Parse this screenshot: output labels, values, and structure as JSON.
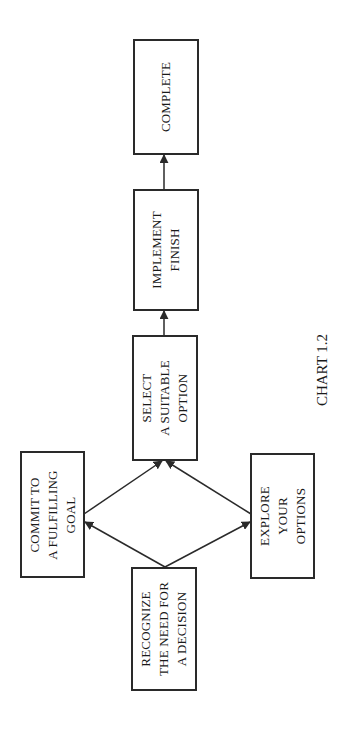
{
  "diagram": {
    "caption": "CHART 1.2",
    "orientation": "rotated-90-ccw",
    "nodes": [
      {
        "id": "recognize",
        "label": "RECOGNIZE\nTHE NEED FOR\nA DECISION"
      },
      {
        "id": "commit",
        "label": "COMMIT TO\nA FULFILLING\nGOAL"
      },
      {
        "id": "explore",
        "label": "EXPLORE\nYOUR\nOPTIONS"
      },
      {
        "id": "select",
        "label": "SELECT\nA SUITABLE\nOPTION"
      },
      {
        "id": "implement",
        "label": "IMPLEMENT\nFINISH"
      },
      {
        "id": "complete",
        "label": "COMPLETE"
      }
    ],
    "edges": [
      {
        "from": "recognize",
        "to": "commit"
      },
      {
        "from": "recognize",
        "to": "explore"
      },
      {
        "from": "commit",
        "to": "select"
      },
      {
        "from": "explore",
        "to": "select"
      },
      {
        "from": "select",
        "to": "implement"
      },
      {
        "from": "implement",
        "to": "complete"
      }
    ],
    "colors": {
      "stroke": "#2a2a2a",
      "background": "#ffffff",
      "text": "#1a1a1a"
    }
  }
}
